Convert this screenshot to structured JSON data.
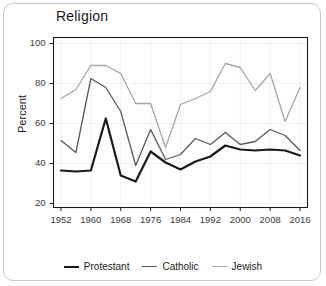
{
  "card": {
    "name": "chart-card"
  },
  "chart_data": {
    "type": "line",
    "title": "Religion",
    "xlabel": "",
    "ylabel": "Percent",
    "xlim": [
      1950,
      2018
    ],
    "ylim": [
      18,
      103
    ],
    "grid": true,
    "legend_position": "bottom",
    "x_ticks": [
      1952,
      1960,
      1968,
      1976,
      1984,
      1992,
      2000,
      2008,
      2016
    ],
    "y_ticks": [
      20,
      40,
      60,
      80,
      100
    ],
    "x": [
      1952,
      1956,
      1960,
      1964,
      1968,
      1972,
      1976,
      1980,
      1984,
      1988,
      1992,
      1996,
      2000,
      2004,
      2008,
      2012,
      2016
    ],
    "series": [
      {
        "name": "Protestant",
        "color": "#1a1a1a",
        "width": 2.2,
        "values": [
          36.5,
          36.0,
          36.5,
          62.5,
          34.0,
          31.0,
          46.0,
          40.5,
          37.0,
          41.0,
          43.5,
          49.0,
          47.0,
          46.5,
          47.0,
          46.5,
          44.0
        ]
      },
      {
        "name": "Catholic",
        "color": "#595959",
        "width": 1.3,
        "values": [
          51.5,
          45.5,
          82.5,
          78.0,
          66.0,
          39.0,
          57.0,
          42.0,
          44.5,
          52.5,
          49.5,
          55.5,
          49.5,
          51.0,
          57.0,
          54.0,
          46.5
        ]
      },
      {
        "name": "Jewish",
        "color": "#a6a6a6",
        "width": 1.3,
        "values": [
          72.5,
          77.0,
          89.0,
          89.0,
          85.0,
          70.0,
          70.0,
          48.0,
          69.5,
          72.5,
          76.0,
          90.0,
          88.0,
          76.5,
          85.0,
          61.0,
          78.0
        ]
      }
    ]
  }
}
